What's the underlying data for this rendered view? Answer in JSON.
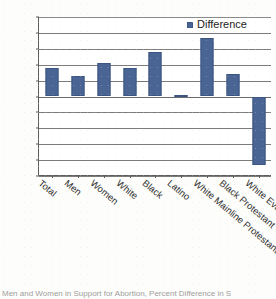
{
  "chart_data": {
    "type": "bar",
    "title": "",
    "xlabel": "",
    "ylabel": "",
    "ylim": [
      -50,
      50
    ],
    "ytick_step": 10,
    "grid": true,
    "legend_position": "top-right",
    "series_name": "Difference",
    "bar_color": "#4a6493",
    "categories": [
      "Total",
      "Men",
      "Women",
      "White",
      "Black",
      "Latino",
      "White Mainline Protestant",
      "Black Protestant",
      "White Evangelical Protestant"
    ],
    "values": [
      18,
      13,
      21,
      18,
      28,
      1,
      37,
      14,
      -43
    ],
    "series": [
      {
        "name": "Difference",
        "values": [
          18,
          13,
          21,
          18,
          28,
          1,
          37,
          14,
          -43
        ]
      }
    ],
    "ytick_labels": [
      "50",
      "40",
      "30",
      "20",
      "10",
      "0",
      "-10",
      "-20",
      "-30",
      "-40",
      "-50"
    ]
  },
  "legend": {
    "entries": [
      {
        "label": "Difference",
        "color": "#4a6493",
        "marker": "square"
      }
    ]
  },
  "caption": {
    "text": "Men and Women in Support for Abortion, Percent Difference in S"
  }
}
